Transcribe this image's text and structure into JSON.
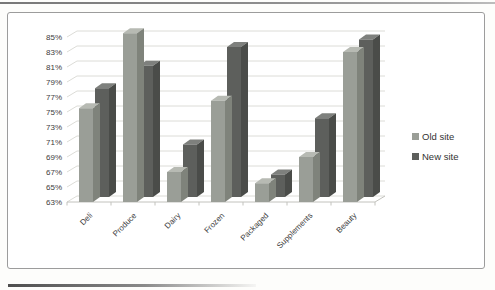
{
  "chart_data": {
    "type": "bar",
    "variant": "3d-clustered-column",
    "title": "",
    "categories": [
      "Deli",
      "Produce",
      "Dairy",
      "Frozen",
      "Packaged",
      "Supplements",
      "Beauty"
    ],
    "series": [
      {
        "name": "Old site",
        "color": "#9a9e97",
        "top_color": "#b7bab3",
        "side_color": "#7f837b",
        "values": [
          75.5,
          85.5,
          67,
          76.5,
          65.5,
          69,
          83
        ]
      },
      {
        "name": "New site",
        "color": "#5d5f5c",
        "top_color": "#7e807d",
        "side_color": "#4a4c49",
        "values": [
          77.5,
          80.5,
          70,
          83,
          66,
          73.5,
          84
        ]
      }
    ],
    "xlabel": "",
    "ylabel": "",
    "ylim": [
      63,
      85
    ],
    "ytick_step": 2,
    "ytick_labels": [
      "63%",
      "65%",
      "67%",
      "69%",
      "71%",
      "73%",
      "75%",
      "77%",
      "79%",
      "81%",
      "83%",
      "85%"
    ],
    "grid": true,
    "legend_position": "right",
    "colors": {
      "grid": "#d8d8d3",
      "axis": "#c2c2bd",
      "text": "#3d3d3d",
      "legend_text": "#333333"
    }
  }
}
